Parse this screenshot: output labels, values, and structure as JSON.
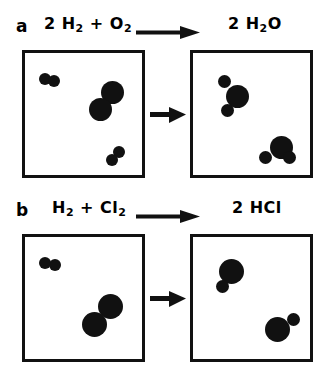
{
  "figure": {
    "background_color": "#ffffff",
    "ink_color": "#111111"
  },
  "panels": [
    {
      "letter": "a",
      "reactants_label": "2 H2 + O2",
      "reactants_parts": [
        {
          "text": "2 H",
          "sub": ""
        },
        {
          "text": "",
          "sub": "2"
        },
        {
          "text": " + O",
          "sub": ""
        },
        {
          "text": "",
          "sub": "2"
        }
      ],
      "products_label": "2 H2O",
      "arrow": "long-right-arrow",
      "middle_arrow": "short-right-arrow",
      "left_box": {
        "name": "reactants-box",
        "molecules": [
          {
            "name": "hydrogen-molecule",
            "formula": "H2",
            "atoms": [
              {
                "element": "H",
                "size": "small"
              },
              {
                "element": "H",
                "size": "small"
              }
            ]
          },
          {
            "name": "oxygen-molecule",
            "formula": "O2",
            "atoms": [
              {
                "element": "O",
                "size": "large"
              },
              {
                "element": "O",
                "size": "large"
              }
            ]
          },
          {
            "name": "hydrogen-molecule",
            "formula": "H2",
            "atoms": [
              {
                "element": "H",
                "size": "small"
              },
              {
                "element": "H",
                "size": "small"
              }
            ]
          }
        ]
      },
      "right_box": {
        "name": "products-box",
        "molecules": [
          {
            "name": "water-molecule",
            "formula": "H2O",
            "atoms": [
              {
                "element": "O",
                "size": "large"
              },
              {
                "element": "H",
                "size": "small"
              },
              {
                "element": "H",
                "size": "small"
              }
            ]
          },
          {
            "name": "water-molecule",
            "formula": "H2O",
            "atoms": [
              {
                "element": "O",
                "size": "large"
              },
              {
                "element": "H",
                "size": "small"
              },
              {
                "element": "H",
                "size": "small"
              }
            ]
          }
        ]
      }
    },
    {
      "letter": "b",
      "reactants_label": "H2 + Cl2",
      "products_label": "2 HCl",
      "arrow": "long-right-arrow",
      "middle_arrow": "short-right-arrow",
      "left_box": {
        "name": "reactants-box",
        "molecules": [
          {
            "name": "hydrogen-molecule",
            "formula": "H2",
            "atoms": [
              {
                "element": "H",
                "size": "small"
              },
              {
                "element": "H",
                "size": "small"
              }
            ]
          },
          {
            "name": "chlorine-molecule",
            "formula": "Cl2",
            "atoms": [
              {
                "element": "Cl",
                "size": "large"
              },
              {
                "element": "Cl",
                "size": "large"
              }
            ]
          }
        ]
      },
      "right_box": {
        "name": "products-box",
        "molecules": [
          {
            "name": "hydrogen-chloride-molecule",
            "formula": "HCl",
            "atoms": [
              {
                "element": "Cl",
                "size": "large"
              },
              {
                "element": "H",
                "size": "small"
              }
            ]
          },
          {
            "name": "hydrogen-chloride-molecule",
            "formula": "HCl",
            "atoms": [
              {
                "element": "Cl",
                "size": "large"
              },
              {
                "element": "H",
                "size": "small"
              }
            ]
          }
        ]
      }
    }
  ],
  "text": {
    "panel_a_letter": "a",
    "panel_a_reactants_prefix": "2 H",
    "panel_a_reactants_sub1": "2",
    "panel_a_reactants_mid": " + O",
    "panel_a_reactants_sub2": "2",
    "panel_a_products_prefix": "2 H",
    "panel_a_products_sub": "2",
    "panel_a_products_suffix": "O",
    "panel_b_letter": "b",
    "panel_b_reactants_prefix": "H",
    "panel_b_reactants_sub1": "2",
    "panel_b_reactants_mid": " + Cl",
    "panel_b_reactants_sub2": "2",
    "panel_b_products": "2 HCl"
  }
}
